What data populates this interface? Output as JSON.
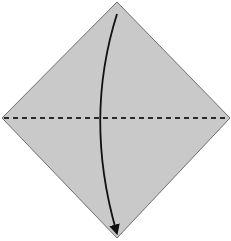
{
  "diagram": {
    "type": "origami-fold-step",
    "paper": {
      "shape": "diamond",
      "fill": "#c9c9c9",
      "stroke": "#6e6e6e",
      "vertices": {
        "top": [
          117,
          2
        ],
        "right": [
          230,
          118
        ],
        "bottom": [
          117,
          238
        ],
        "left": [
          2,
          118
        ]
      }
    },
    "fold_line": {
      "style": "valley-dashed",
      "color": "#2a2a2a",
      "from": [
        4,
        118
      ],
      "to": [
        228,
        118
      ]
    },
    "arrow": {
      "meaning": "fold top corner down to bottom corner",
      "color": "#111111",
      "start": [
        117,
        14
      ],
      "control": [
        84,
        118
      ],
      "end": [
        116,
        230
      ]
    }
  }
}
